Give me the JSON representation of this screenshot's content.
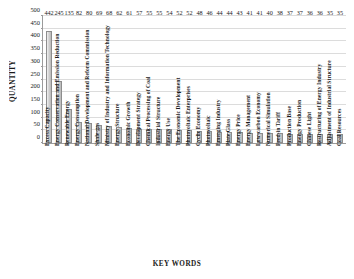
{
  "chart_data": {
    "type": "bar",
    "title": "",
    "xlabel": "KEY WORDS",
    "ylabel": "QUANTITY",
    "ylim": [
      0,
      500
    ],
    "yticks": [
      0,
      50,
      100,
      150,
      200,
      250,
      300,
      350,
      400,
      450,
      500
    ],
    "grid": true,
    "legend": "none",
    "bar_color": "#cccccc",
    "bar_border_color": "#8d8d8d",
    "categories": [
      "Excess Capacity",
      "Energy Conservation and Emission Reduction",
      "Renewable Energy",
      "Energy Consumption",
      "National Development and Reform Commission",
      "Shale-gas",
      "Ministry of Industry and Information Technology",
      "Energy Structure",
      "Economic Growth",
      "Development Strategy",
      "Chemical Processing of Coal",
      "Industrial Structure",
      "Energy Use",
      "The Economic Development",
      "Photovoltaic Enterprises",
      "Cyclic Economy",
      "Photovoltaic",
      "Emerging Industry",
      "Plate Glass",
      "Energy Price",
      "Energy Management",
      "Low-carbon Economy",
      "Numerical Simulation",
      "Feed-in Tariff",
      "Production Base",
      "Energy Production",
      "Chinese Light",
      "Restructuring of Energy Industry",
      "Adjustment of Industrial Structure",
      "Coal Resources"
    ],
    "values": [
      442,
      245,
      135,
      82,
      80,
      69,
      68,
      62,
      61,
      57,
      55,
      55,
      54,
      52,
      52,
      48,
      46,
      44,
      44,
      43,
      41,
      41,
      40,
      38,
      37,
      37,
      36,
      36,
      35,
      35
    ]
  }
}
